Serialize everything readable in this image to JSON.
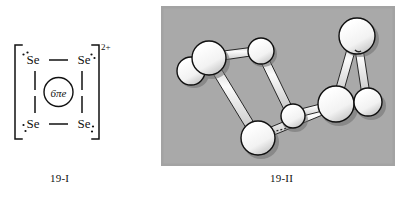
{
  "figure": {
    "panels": [
      {
        "id": "19-I",
        "caption": "19-I",
        "type": "lewis-structure",
        "charge_label": "2+",
        "center_label": "6πe",
        "atoms": [
          {
            "symbol": "Se",
            "position": "top-left",
            "lone_pair_dots": 2
          },
          {
            "symbol": "Se",
            "position": "top-right",
            "lone_pair_dots": 2
          },
          {
            "symbol": "Se",
            "position": "bottom-left",
            "lone_pair_dots": 2
          },
          {
            "symbol": "Se",
            "position": "bottom-right",
            "lone_pair_dots": 2
          }
        ],
        "bonds": [
          "top-left—top-right",
          "top-left|bottom-left",
          "top-right|bottom-right",
          "bottom-left—bottom-right"
        ],
        "bracket": "square-bracket-pair"
      },
      {
        "id": "19-II",
        "caption": "19-II",
        "type": "ball-and-stick-photograph",
        "background_color": "#a9a9a9",
        "ball_color": "#f4f4f4",
        "ball_outline_color": "#101010",
        "rod_color": "#ededed",
        "ball_count": 8,
        "rod_count": 9
      }
    ]
  },
  "colors": {
    "ink": "#111111",
    "photo_background": "#a9a9a9",
    "ball_fill": "#f4f4f4",
    "ball_stroke": "#101010",
    "rod_fill": "#ececec",
    "rod_stroke": "#1a1a1a",
    "page_background": "#ffffff"
  },
  "lewis": {
    "se_top_left": "Se",
    "se_top_right": "Se",
    "se_bottom_left": "Se",
    "se_bottom_right": "Se",
    "charge": "2+",
    "aromatic": "6πe"
  },
  "captions": {
    "left": "19-I",
    "right": "19-II"
  }
}
